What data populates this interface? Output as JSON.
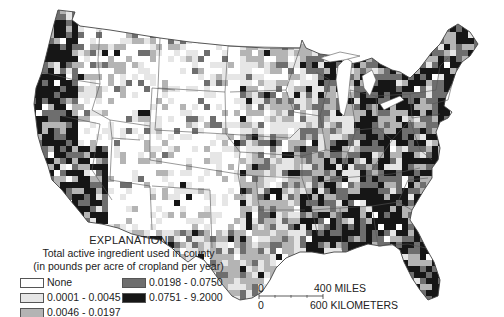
{
  "legend": {
    "title": "EXPLANATION",
    "subtitle_line1": "Total active ingredient used in county",
    "subtitle_line2": "(in pounds per acre of cropland per year)",
    "classes": [
      {
        "label": "None",
        "color": "#ffffff"
      },
      {
        "label": "0.0001 - 0.0045",
        "color": "#e6e6e6"
      },
      {
        "label": "0.0046 - 0.0197",
        "color": "#b4b4b4"
      },
      {
        "label": "0.0198 - 0.0750",
        "color": "#6e6e6e"
      },
      {
        "label": "0.0751 - 9.2000",
        "color": "#161616"
      }
    ]
  },
  "scale_bar": {
    "miles_zero": "0",
    "miles_label": "400 MILES",
    "km_zero": "0",
    "km_label": "600 KILOMETERS"
  },
  "map": {
    "region": "Conterminous United States",
    "boundary_color": "#555555"
  }
}
